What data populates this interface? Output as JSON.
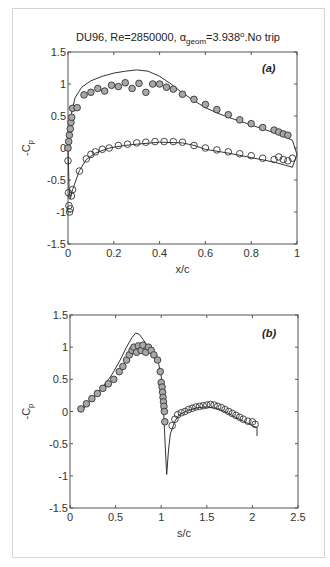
{
  "figure": {
    "title_prefix": "DU96, Re=2850000, ",
    "title_alpha": "α",
    "title_sub": "geom",
    "title_suffix": "=3.938",
    "title_deg": "o",
    "title_end": ".No trip"
  },
  "chart_data": [
    {
      "type": "scatter",
      "panel": "(a)",
      "title": "DU96, Re=2850000, α_geom=3.938°.No trip",
      "xlabel": "x/c",
      "ylabel": "-C_p",
      "xlim": [
        0,
        1
      ],
      "ylim": [
        -1.5,
        1.5
      ],
      "xticks": [
        "0",
        "0.2",
        "0.4",
        "0.6",
        "0.8",
        "1"
      ],
      "yticks": [
        "1.5",
        "1",
        "0.5",
        "0",
        "-0.5",
        "-1",
        "-1.5"
      ],
      "grid": false,
      "series": [
        {
          "name": "suction side (experiment, filled)",
          "style": "gray-filled-circle",
          "x": [
            0.0,
            0.003,
            0.006,
            0.01,
            0.013,
            0.016,
            0.02,
            0.04,
            0.07,
            0.1,
            0.13,
            0.16,
            0.19,
            0.22,
            0.25,
            0.28,
            0.31,
            0.34,
            0.37,
            0.4,
            0.43,
            0.46,
            0.5,
            0.55,
            0.6,
            0.65,
            0.7,
            0.75,
            0.8,
            0.85,
            0.9,
            0.92,
            0.94,
            0.96
          ],
          "y": [
            0.0,
            0.1,
            0.2,
            0.3,
            0.4,
            0.48,
            0.62,
            0.63,
            0.83,
            0.87,
            0.93,
            0.89,
            0.98,
            0.96,
            1.02,
            0.93,
            1.01,
            0.87,
            1.0,
            1.0,
            0.95,
            0.92,
            0.84,
            0.76,
            0.68,
            0.6,
            0.52,
            0.44,
            0.38,
            0.32,
            0.28,
            0.25,
            0.22,
            0.2
          ]
        },
        {
          "name": "pressure side (experiment, open)",
          "style": "open-circle",
          "x": [
            0.0,
            0.002,
            0.004,
            0.007,
            0.01,
            0.015,
            0.02,
            0.05,
            0.08,
            0.1,
            0.12,
            0.15,
            0.18,
            0.22,
            0.26,
            0.3,
            0.34,
            0.38,
            0.42,
            0.46,
            0.5,
            0.55,
            0.6,
            0.65,
            0.7,
            0.75,
            0.8,
            0.85,
            0.9,
            0.92,
            0.94,
            0.96,
            0.98
          ],
          "y": [
            -0.2,
            -0.7,
            -0.9,
            -1.0,
            -0.95,
            -0.75,
            -0.65,
            -0.36,
            -0.17,
            -0.1,
            -0.06,
            -0.02,
            0.0,
            0.04,
            0.06,
            0.08,
            0.09,
            0.1,
            0.1,
            0.1,
            0.09,
            0.04,
            0.0,
            -0.03,
            -0.06,
            -0.09,
            -0.12,
            -0.16,
            -0.18,
            -0.14,
            -0.18,
            -0.2,
            -0.16
          ]
        },
        {
          "name": "suction side (computed)",
          "style": "line",
          "x": [
            0.0,
            0.01,
            0.03,
            0.06,
            0.1,
            0.15,
            0.2,
            0.25,
            0.3,
            0.35,
            0.4,
            0.45,
            0.5,
            0.55,
            0.6,
            0.65,
            0.7,
            0.75,
            0.8,
            0.85,
            0.9,
            0.95,
            0.98,
            1.0
          ],
          "y": [
            0.0,
            0.45,
            0.78,
            0.95,
            1.05,
            1.12,
            1.17,
            1.2,
            1.22,
            1.2,
            1.12,
            1.0,
            0.86,
            0.74,
            0.63,
            0.55,
            0.48,
            0.42,
            0.36,
            0.3,
            0.24,
            0.17,
            0.12,
            -0.1
          ]
        },
        {
          "name": "pressure side (computed)",
          "style": "line",
          "x": [
            0.0,
            0.005,
            0.01,
            0.02,
            0.05,
            0.08,
            0.12,
            0.18,
            0.25,
            0.3,
            0.4,
            0.5,
            0.55,
            0.6,
            0.7,
            0.8,
            0.9,
            0.95,
            0.98,
            1.0
          ],
          "y": [
            0.0,
            -0.65,
            -0.8,
            -0.65,
            -0.35,
            -0.18,
            -0.08,
            0.0,
            0.04,
            0.06,
            0.09,
            0.08,
            0.04,
            -0.02,
            -0.08,
            -0.15,
            -0.22,
            -0.27,
            -0.3,
            -0.1
          ]
        }
      ]
    },
    {
      "type": "scatter",
      "panel": "(b)",
      "xlabel": "s/c",
      "ylabel": "-C_p",
      "xlim": [
        0,
        2.5
      ],
      "ylim": [
        -1.5,
        1.5
      ],
      "xticks": [
        "0",
        "0.5",
        "1",
        "1.5",
        "2",
        "2.5"
      ],
      "yticks": [
        "1.5",
        "1",
        "0.5",
        "0",
        "-0.5",
        "-1",
        "-1.5"
      ],
      "grid": false,
      "series": [
        {
          "name": "suction side (experiment, filled)",
          "style": "gray-filled-circle",
          "x": [
            0.12,
            0.18,
            0.24,
            0.3,
            0.36,
            0.42,
            0.48,
            0.54,
            0.58,
            0.62,
            0.65,
            0.68,
            0.7,
            0.73,
            0.75,
            0.78,
            0.8,
            0.83,
            0.86,
            0.89,
            0.92,
            0.96,
            0.99,
            1.0,
            1.01,
            1.015,
            1.02,
            1.025,
            1.03,
            1.035,
            1.04
          ],
          "y": [
            0.04,
            0.12,
            0.2,
            0.28,
            0.36,
            0.43,
            0.5,
            0.62,
            0.7,
            0.8,
            0.88,
            0.95,
            1.0,
            0.92,
            1.02,
            0.95,
            1.03,
            0.92,
            1.0,
            0.95,
            0.88,
            0.8,
            0.62,
            0.45,
            0.38,
            0.3,
            0.22,
            0.15,
            0.08,
            0.0,
            -0.16
          ]
        },
        {
          "name": "pressure side (experiment, open)",
          "style": "open-circle",
          "x": [
            1.12,
            1.15,
            1.18,
            1.22,
            1.26,
            1.3,
            1.34,
            1.38,
            1.42,
            1.46,
            1.5,
            1.54,
            1.58,
            1.62,
            1.66,
            1.7,
            1.74,
            1.78,
            1.82,
            1.86,
            1.9,
            1.95,
            2.0,
            2.03
          ],
          "y": [
            -0.22,
            -0.12,
            -0.05,
            -0.02,
            0.0,
            0.03,
            0.05,
            0.07,
            0.08,
            0.09,
            0.1,
            0.11,
            0.1,
            0.08,
            0.06,
            0.03,
            0.0,
            -0.03,
            -0.06,
            -0.09,
            -0.12,
            -0.15,
            -0.16,
            -0.2
          ]
        },
        {
          "name": "computed",
          "style": "line",
          "x": [
            0.12,
            0.3,
            0.45,
            0.55,
            0.62,
            0.68,
            0.72,
            0.76,
            0.8,
            0.86,
            0.92,
            0.97,
            1.0,
            1.02,
            1.04,
            1.06,
            1.08,
            1.1,
            1.15,
            1.2,
            1.3,
            1.4,
            1.5,
            1.6,
            1.7,
            1.8,
            1.9,
            2.0,
            2.05,
            2.05
          ],
          "y": [
            0.0,
            0.28,
            0.55,
            0.8,
            1.0,
            1.15,
            1.22,
            1.2,
            1.12,
            1.0,
            0.9,
            0.75,
            0.55,
            0.2,
            -0.4,
            -0.98,
            -0.6,
            -0.35,
            -0.15,
            -0.05,
            0.02,
            0.06,
            0.07,
            0.05,
            0.0,
            -0.08,
            -0.15,
            -0.22,
            -0.25,
            -0.38
          ]
        }
      ]
    }
  ]
}
